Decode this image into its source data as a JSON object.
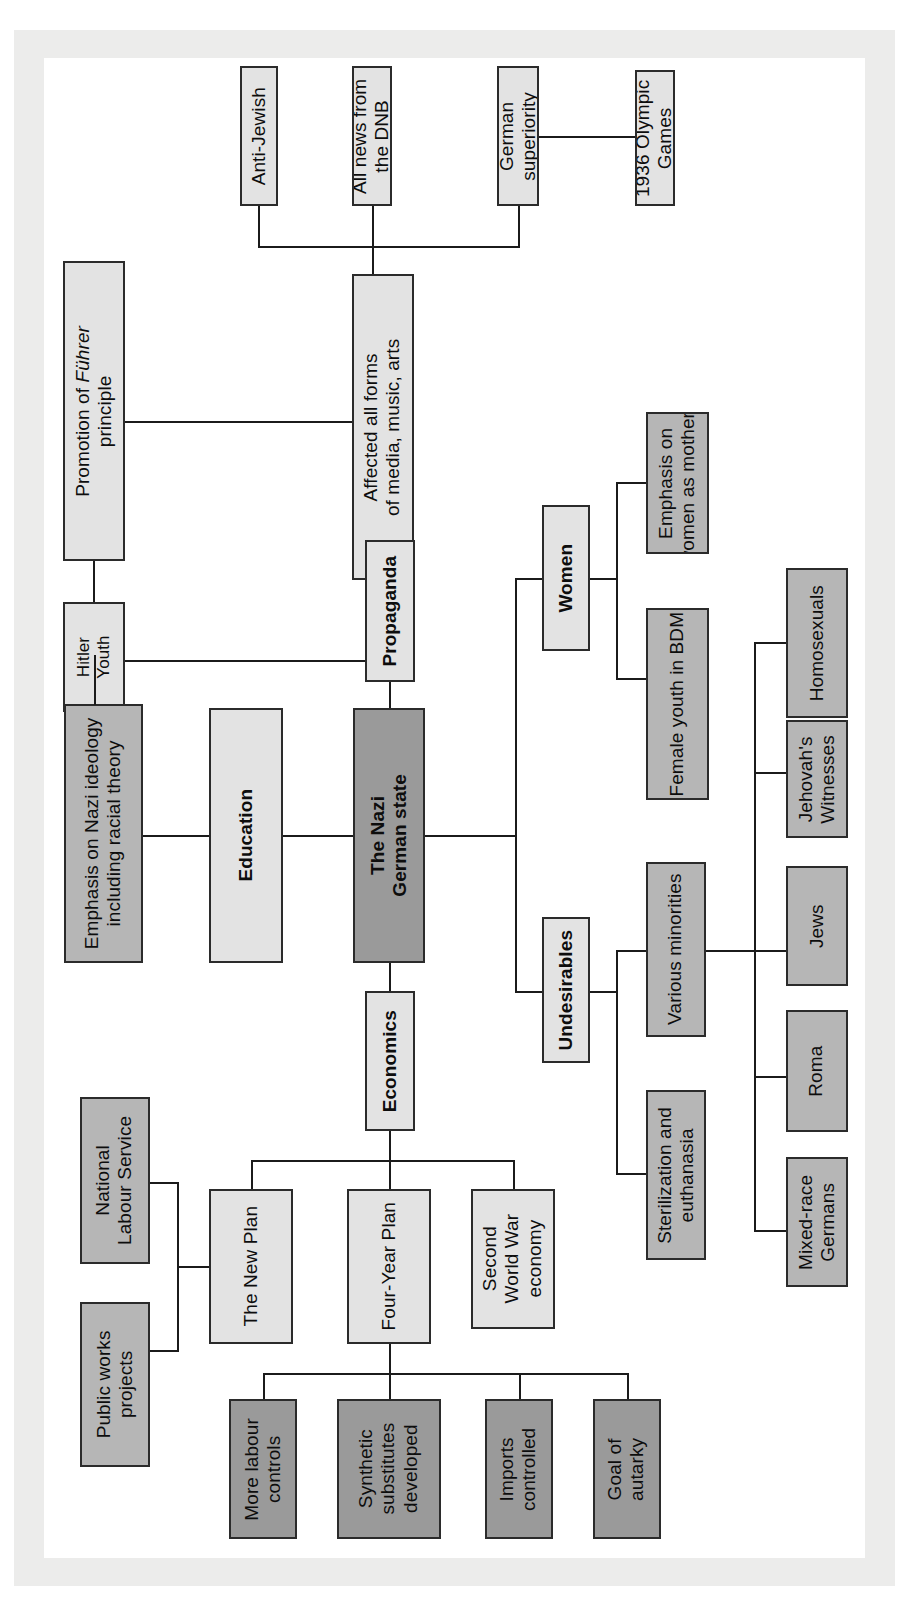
{
  "diagram": {
    "type": "mind-map",
    "orientation": "rotated-90-ccw",
    "palette": {
      "light_fill": "#e3e3e3",
      "mid_fill": "#b6b6b6",
      "dark_fill": "#9a9a9a",
      "border": "#2b2b2b",
      "page_frame": "#ececeb",
      "sheet": "#ffffff",
      "text": "#0d0d0d"
    },
    "nodes": {
      "centre": "The Nazi German state",
      "education": "Education",
      "emphasis_nazi_ideology": "Emphasis on Nazi ideology including racial theory",
      "hitler_youth": "Hitler Youth",
      "promotion_fuhrer": "Promotion of Führer principle",
      "promotion_fuhrer_pre": "Promotion of ",
      "promotion_fuhrer_ital": "Führer",
      "promotion_fuhrer_post": " principle",
      "propaganda": "Propaganda",
      "affected_all_forms": "Affected all forms of media, music, arts",
      "anti_jewish": "Anti-Jewish",
      "all_news_dnb": "All news from the DNB",
      "german_superiority": "German superiority",
      "olympic_games": "1936 Olympic Games",
      "women": "Women",
      "emphasis_mothers": "Emphasis on women as mothers",
      "female_youth_bdm": "Female youth in BDM",
      "undesirables": "Undesirables",
      "various_minorities": "Various minorities",
      "sterilization": "Sterilization and euthanasia",
      "homosexuals": "Homosexuals",
      "jehovahs_witnesses": "Jehovah's Witnesses",
      "jews": "Jews",
      "roma": "Roma",
      "mixed_race_germans": "Mixed-race Germans",
      "economics": "Economics",
      "the_new_plan": "The New Plan",
      "four_year_plan": "Four-Year Plan",
      "second_world_war_economy": "Second World War economy",
      "national_labour_service": "National Labour Service",
      "public_works_projects": "Public works projects",
      "more_labour_controls": "More labour controls",
      "synthetic_substitutes": "Synthetic substitutes developed",
      "imports_controlled": "Imports controlled",
      "goal_of_autarky": "Goal of autarky"
    },
    "branches": [
      {
        "name": "Education",
        "children": [
          "Emphasis on Nazi ideology including racial theory",
          "Hitler Youth"
        ],
        "grandchildren": [
          "Promotion of Führer principle"
        ]
      },
      {
        "name": "Propaganda",
        "children": [
          "Affected all forms of media, music, arts"
        ],
        "grandchildren": [
          "Anti-Jewish",
          "All news from the DNB",
          "German superiority"
        ],
        "great_grandchildren": [
          "1936 Olympic Games"
        ]
      },
      {
        "name": "Women",
        "children": [
          "Emphasis on women as mothers",
          "Female youth in BDM"
        ]
      },
      {
        "name": "Undesirables",
        "children": [
          "Various minorities",
          "Sterilization and euthanasia"
        ],
        "grandchildren": [
          "Homosexuals",
          "Jehovah's Witnesses",
          "Jews",
          "Roma",
          "Mixed-race Germans"
        ]
      },
      {
        "name": "Economics",
        "children": [
          "The New Plan",
          "Four-Year Plan",
          "Second World War economy"
        ],
        "grandchildren": [
          "National Labour Service",
          "Public works projects",
          "More labour controls",
          "Synthetic substitutes developed",
          "Imports controlled",
          "Goal of autarky"
        ]
      }
    ]
  }
}
